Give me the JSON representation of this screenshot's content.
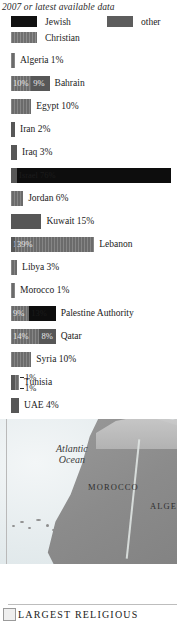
{
  "header": {
    "subtitle": "2007 or latest available data"
  },
  "legend": {
    "items": [
      {
        "label": "Jewish",
        "key": "jewish",
        "color": "#111111"
      },
      {
        "label": "other",
        "key": "other",
        "color": "#5d5d5d"
      },
      {
        "label": "Christian",
        "key": "christian",
        "color": "#6f6f6f"
      }
    ]
  },
  "chart_data": {
    "type": "bar",
    "subtitle": "2007 or latest available data",
    "xlabel": "",
    "ylabel": "",
    "orientation": "horizontal",
    "stacked": true,
    "unit": "percent",
    "xlim": [
      0,
      80
    ],
    "grid": false,
    "legend_position": "top",
    "series": [
      {
        "name": "Jewish",
        "color": "#0d0d0d"
      },
      {
        "name": "other",
        "color": "#575757"
      },
      {
        "name": "Christian",
        "color": "#6b6b6b"
      }
    ],
    "categories": [
      "Algeria",
      "Bahrain",
      "Egypt",
      "Iran",
      "Iraq",
      "Israel",
      "Jordan",
      "Kuwait",
      "Lebanon",
      "Libya",
      "Morocco",
      "Palestine Authority",
      "Qatar",
      "Syria",
      "Tunisia",
      "UAE"
    ],
    "rows": [
      {
        "category": "Algeria",
        "label": "Algeria 1%",
        "label_position": "outside",
        "segments": [
          {
            "series": "christian",
            "value": 1,
            "value_label": "",
            "label_inside": false
          }
        ]
      },
      {
        "category": "Bahrain",
        "label": "Bahrain",
        "label_position": "outside",
        "segments": [
          {
            "series": "christian",
            "value": 10,
            "value_label": "10%",
            "label_inside": true
          },
          {
            "series": "other",
            "value": 9,
            "value_label": "9%",
            "label_inside": true
          }
        ]
      },
      {
        "category": "Egypt",
        "label": "Egypt 10%",
        "label_position": "outside",
        "segments": [
          {
            "series": "christian",
            "value": 10,
            "value_label": "",
            "label_inside": false
          }
        ]
      },
      {
        "category": "Iran",
        "label": "Iran 2%",
        "label_position": "outside",
        "segments": [
          {
            "series": "other",
            "value": 2,
            "value_label": "",
            "label_inside": false
          }
        ]
      },
      {
        "category": "Iraq",
        "label": "Iraq 3%",
        "label_position": "outside",
        "segments": [
          {
            "series": "other",
            "value": 3,
            "value_label": "",
            "label_inside": false
          }
        ]
      },
      {
        "category": "Israel",
        "label": "",
        "label_position": "inside",
        "segments": [
          {
            "series": "other",
            "value": 3,
            "value_label": "",
            "label_inside": false
          },
          {
            "series": "jewish",
            "value": 76,
            "value_label": "Israel  76%",
            "label_inside": true
          }
        ]
      },
      {
        "category": "Jordan",
        "label": "Jordan 6%",
        "label_position": "outside",
        "segments": [
          {
            "series": "christian",
            "value": 6,
            "value_label": "",
            "label_inside": false
          }
        ]
      },
      {
        "category": "Kuwait",
        "label": "Kuwait 15%",
        "label_position": "outside",
        "segments": [
          {
            "series": "other",
            "value": 15,
            "value_label": "",
            "label_inside": false
          }
        ]
      },
      {
        "category": "Lebanon",
        "label": "Lebanon",
        "label_position": "outside",
        "segments": [
          {
            "series": "other",
            "value": 1,
            "value_label": "1%",
            "label_inside": true,
            "leader": true
          },
          {
            "series": "christian",
            "value": 39,
            "value_label": "39%",
            "label_inside": true
          }
        ]
      },
      {
        "category": "Libya",
        "label": "Libya 3%",
        "label_position": "outside",
        "segments": [
          {
            "series": "christian",
            "value": 3,
            "value_label": "",
            "label_inside": false
          }
        ]
      },
      {
        "category": "Morocco",
        "label": "Morocco 1%",
        "label_position": "outside",
        "segments": [
          {
            "series": "christian",
            "value": 1,
            "value_label": "",
            "label_inside": false
          }
        ]
      },
      {
        "category": "Palestine Authority",
        "label": "Palestine Authority",
        "label_position": "outside",
        "segments": [
          {
            "series": "christian",
            "value": 9,
            "value_label": "9%",
            "label_inside": true
          },
          {
            "series": "jewish",
            "value": 13,
            "value_label": "13%",
            "label_inside": true
          }
        ]
      },
      {
        "category": "Qatar",
        "label": "Qatar",
        "label_position": "outside",
        "segments": [
          {
            "series": "christian",
            "value": 14,
            "value_label": "14%",
            "label_inside": true
          },
          {
            "series": "other",
            "value": 8,
            "value_label": "8%",
            "label_inside": true
          }
        ]
      },
      {
        "category": "Syria",
        "label": "Syria 10%",
        "label_position": "outside",
        "segments": [
          {
            "series": "christian",
            "value": 10,
            "value_label": "",
            "label_inside": false
          }
        ]
      },
      {
        "category": "Tunisia",
        "label": "Tunisia",
        "label_position": "outside",
        "segments": [
          {
            "series": "other",
            "value": 1,
            "value_label": "1%",
            "label_inside": false,
            "leader": true
          },
          {
            "series": "christian",
            "value": 1,
            "value_label": "1%",
            "label_inside": false,
            "leader": true
          }
        ]
      },
      {
        "category": "UAE",
        "label": "UAE 4%",
        "label_position": "outside",
        "segments": [
          {
            "series": "other",
            "value": 4,
            "value_label": "",
            "label_inside": false
          }
        ]
      }
    ]
  },
  "map": {
    "labels": {
      "ocean_line1": "Atlantic",
      "ocean_line2": "Ocean",
      "morocco": "MOROCCO",
      "algeria": "ALGER"
    }
  },
  "caption": {
    "text": "LARGEST RELIGIOUS"
  }
}
